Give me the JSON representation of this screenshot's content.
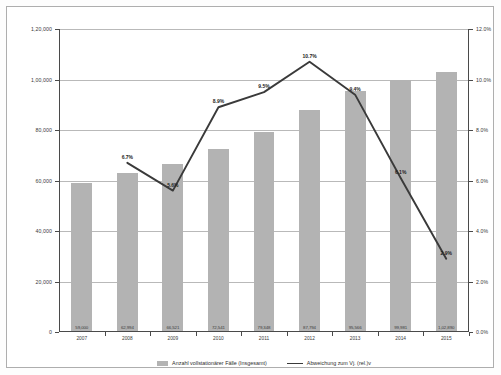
{
  "chart_data": {
    "type": "bar",
    "title": "",
    "subtitle": "",
    "xlabel": "",
    "ylabel": "",
    "categories": [
      "2007",
      "2008",
      "2009",
      "2010",
      "2011",
      "2012",
      "2013",
      "2014",
      "2015"
    ],
    "series": [
      {
        "name": "Anzahl vollstationärer Fälle (Insgesamt)",
        "type": "bar",
        "axis": "left",
        "color": "#b3b3b3",
        "values": [
          59000,
          62994,
          66521,
          72541,
          79348,
          87794,
          95566,
          99981,
          102890
        ],
        "value_labels": [
          "59,000",
          "62,994",
          "66,521",
          "72,541",
          "79,348",
          "87,794",
          "95,566",
          "99,981",
          "1,02,890"
        ]
      },
      {
        "name": "Abweichung zum Vj. (rel.)v",
        "type": "line",
        "axis": "right",
        "color": "#3a3a3a",
        "values": [
          null,
          6.7,
          5.6,
          8.9,
          9.5,
          10.7,
          9.4,
          6.1,
          2.9
        ],
        "value_labels": [
          null,
          "6.7%",
          "5.6%",
          "8.9%",
          "9.5%",
          "10.7%",
          "9.4%",
          "6.1%",
          "2.9%"
        ]
      }
    ],
    "y_left": {
      "min": 0,
      "max": 120000,
      "ticks": [
        0,
        20000,
        40000,
        60000,
        80000,
        100000,
        120000
      ],
      "tick_labels": [
        "0",
        "20,000",
        "40,000",
        "60,000",
        "80,000",
        "1,00,000",
        "1,20,000"
      ]
    },
    "y_right": {
      "min": 0,
      "max": 12,
      "ticks": [
        0,
        2,
        4,
        6,
        8,
        10,
        12
      ],
      "tick_labels": [
        "0.0%",
        "2.0%",
        "4.0%",
        "6.0%",
        "8.0%",
        "10.0%",
        "12.0%"
      ]
    },
    "grid": true,
    "legend_position": "bottom",
    "legend": [
      {
        "label": "Anzahl vollstationärer Fälle (Insgesamt)",
        "marker": "bar",
        "color": "#b3b3b3"
      },
      {
        "label": "Abweichung zum Vj. (rel.)v",
        "marker": "line",
        "color": "#3a3a3a"
      }
    ]
  }
}
